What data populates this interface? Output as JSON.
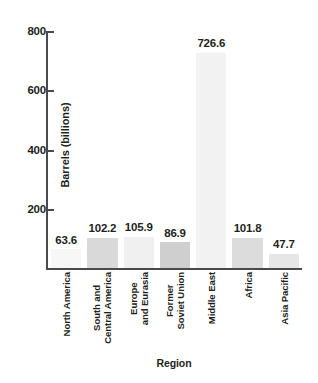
{
  "chart_data": {
    "type": "bar",
    "title": "",
    "xlabel": "Region",
    "ylabel": "Barrels (billions)",
    "categories": [
      "North America",
      "South and\nCentral America",
      "Europe\nand Eurasia",
      "Former\nSoviet Union",
      "Middle East",
      "Africa",
      "Asia Pacific"
    ],
    "values": [
      63.6,
      102.2,
      105.9,
      86.9,
      726.6,
      101.8,
      47.7
    ],
    "value_labels": [
      "63.6",
      "102.2",
      "105.9",
      "86.9",
      "726.6",
      "101.8",
      "47.7"
    ],
    "bar_colors": [
      "#f7f7f7",
      "#d9d9d9",
      "#f0f0f0",
      "#cfcfcf",
      "#f2f2f2",
      "#dcdcdc",
      "#e6e6e6"
    ],
    "ylim": [
      0,
      800
    ],
    "yticks": [
      200,
      400,
      600,
      800
    ],
    "ytick_labels": [
      "200",
      "400",
      "600",
      "800"
    ],
    "grid": false,
    "legend": false,
    "axis_color": "#4a4a4a",
    "text_color": "#231f20"
  },
  "axes": {
    "y_title": "Barrels (billions)",
    "x_title": "Region"
  }
}
